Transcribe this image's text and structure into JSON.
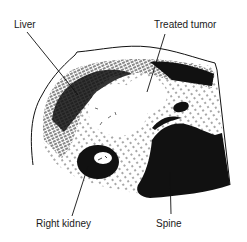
{
  "diagram": {
    "type": "anatomical-illustration",
    "labels": {
      "liver": "Liver",
      "treated_tumor": "Treated tumor",
      "right_kidney": "Right kidney",
      "spine": "Spine"
    },
    "colors": {
      "ink": "#111111",
      "background": "#ffffff"
    }
  }
}
